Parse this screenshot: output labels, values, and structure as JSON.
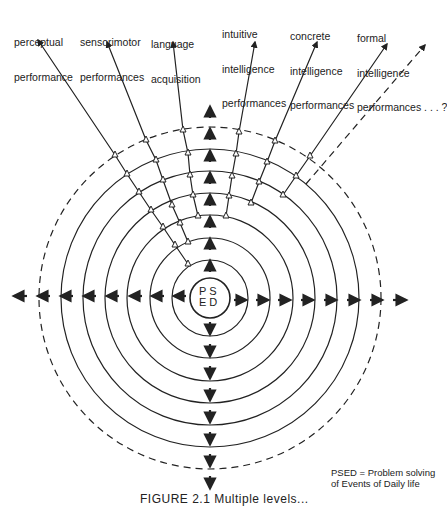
{
  "labels": [
    {
      "id": "perceptual",
      "lines": [
        "perceptual",
        "performance"
      ]
    },
    {
      "id": "sensorimotor",
      "lines": [
        "sensorimotor",
        "performances"
      ]
    },
    {
      "id": "language",
      "lines": [
        "language",
        "acquisition"
      ]
    },
    {
      "id": "intuitive",
      "lines": [
        "intuitive",
        "intelligence",
        "performances"
      ]
    },
    {
      "id": "concrete",
      "lines": [
        "concrete",
        "intelligence",
        "performances"
      ]
    },
    {
      "id": "formal",
      "lines": [
        "formal",
        "intelligence",
        "performances . . . ?"
      ]
    }
  ],
  "center": {
    "row1": "PS",
    "row2": "ED"
  },
  "legend": {
    "line1": "PSED = Problem solving",
    "line2": "of Events of Daily life"
  },
  "caption": "FIGURE 2.1  Multiple levels...",
  "diagram": {
    "center_x": 210,
    "center_y": 298,
    "core_radius": 20,
    "ring_radii": [
      38,
      60,
      83,
      105,
      127,
      149
    ],
    "dashed_ring_radius": 171,
    "line_color": "#222222"
  }
}
